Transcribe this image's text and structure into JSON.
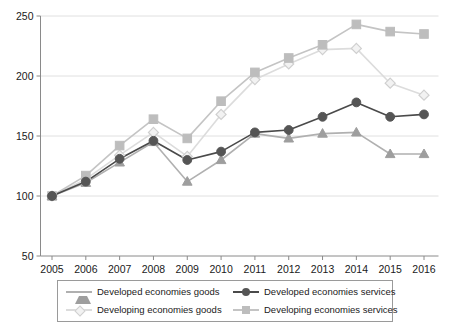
{
  "chart_data": {
    "type": "line",
    "title": "",
    "subtitle": "",
    "xlabel": "",
    "ylabel": "",
    "categories": [
      "2005",
      "2006",
      "2007",
      "2008",
      "2009",
      "2010",
      "2011",
      "2012",
      "2013",
      "2014",
      "2015",
      "2016"
    ],
    "x": [
      2005,
      2006,
      2007,
      2008,
      2009,
      2010,
      2011,
      2012,
      2013,
      2014,
      2015,
      2016
    ],
    "ylim": [
      50,
      250
    ],
    "yticks": [
      50,
      100,
      150,
      200,
      250
    ],
    "ytick_labels": [
      "50",
      "100",
      "150",
      "200",
      "250"
    ],
    "grid": "horizontal",
    "legend_position": "bottom",
    "series": [
      {
        "name": "Developed economies goods",
        "marker": "triangle",
        "color": "#9e9e9e",
        "line_color": "#b0b0b0",
        "values": [
          100,
          111,
          128,
          145,
          112,
          130,
          152,
          148,
          152,
          153,
          135,
          135
        ]
      },
      {
        "name": "Developed economies services",
        "marker": "circle",
        "color": "#555555",
        "line_color": "#4a4a4a",
        "values": [
          100,
          112,
          131,
          146,
          130,
          137,
          153,
          155,
          166,
          178,
          166,
          168
        ]
      },
      {
        "name": "Developing economies goods",
        "marker": "diamond",
        "color": "#e2e2e2",
        "line_color": "#dcdcdc",
        "values": [
          100,
          114,
          134,
          153,
          133,
          168,
          197,
          210,
          222,
          223,
          194,
          184
        ]
      },
      {
        "name": "Developing economies services",
        "marker": "square",
        "color": "#bdbdbd",
        "line_color": "#c4c4c4",
        "values": [
          100,
          117,
          142,
          164,
          148,
          179,
          203,
          215,
          226,
          243,
          237,
          235
        ]
      }
    ]
  },
  "axis": {
    "y_axis_color": "#8a8a8a",
    "x_axis_color": "#8a8a8a",
    "gridline_color": "#e0e0e0"
  },
  "legend": {
    "items": [
      {
        "label": "Developed economies goods",
        "marker": "triangle",
        "color": "#9e9e9e",
        "line_color": "#b0b0b0"
      },
      {
        "label": "Developed economies services",
        "marker": "circle",
        "color": "#555555",
        "line_color": "#4a4a4a"
      },
      {
        "label": "Developing economies goods",
        "marker": "diamond",
        "color": "#e6e6e6",
        "line_color": "#dcdcdc"
      },
      {
        "label": "Developing economies services",
        "marker": "square",
        "color": "#bdbdbd",
        "line_color": "#c4c4c4"
      }
    ]
  }
}
